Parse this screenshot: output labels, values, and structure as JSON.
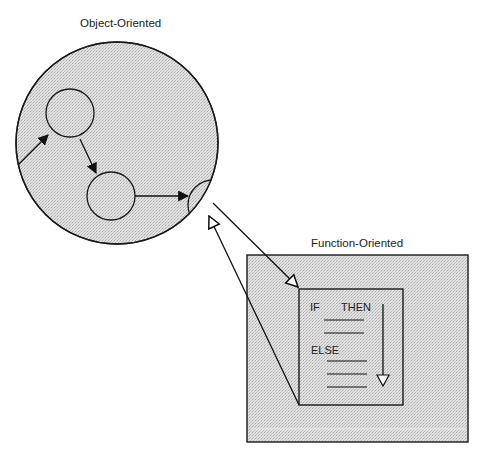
{
  "diagram": {
    "object_oriented": {
      "label": "Object-Oriented",
      "nodes": [
        "object-1",
        "object-2",
        "object-3-partial"
      ],
      "flow": [
        "external-entry -> object-1",
        "object-1 -> object-2",
        "object-2 -> object-3"
      ]
    },
    "function_oriented": {
      "label": "Function-Oriented",
      "code_block": {
        "if_label": "IF",
        "then_label": "THEN",
        "else_label": "ELSE",
        "then_lines": 2,
        "else_lines": 3,
        "flow_arrow": "downward"
      }
    },
    "connections": [
      {
        "from": "object-3",
        "to": "function-block",
        "arrowhead": "hollow"
      },
      {
        "from": "function-block",
        "to": "object-3",
        "arrowhead": "hollow"
      }
    ],
    "colors": {
      "fill": "#dcdcdc",
      "stroke": "#1a1a1a",
      "background": "#ffffff"
    }
  }
}
